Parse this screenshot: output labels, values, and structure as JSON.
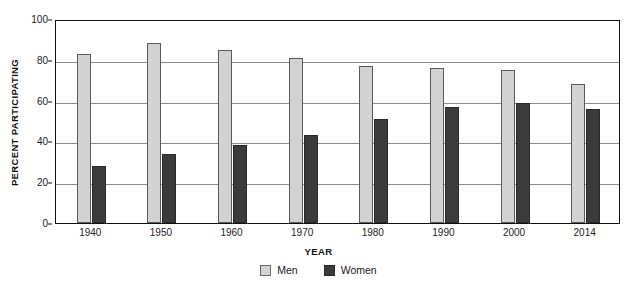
{
  "chart_data": {
    "type": "bar",
    "title": "",
    "xlabel": "YEAR",
    "ylabel": "PERCENT PARTICIPATING",
    "categories": [
      "1940",
      "1950",
      "1960",
      "1970",
      "1980",
      "1990",
      "2000",
      "2014"
    ],
    "series": [
      {
        "name": "Men",
        "color": "#d2d2d2",
        "values": [
          83,
          88,
          85,
          81,
          77,
          76,
          75,
          68
        ]
      },
      {
        "name": "Women",
        "color": "#3b3b3b",
        "values": [
          28,
          34,
          38,
          43,
          51,
          57,
          59,
          56
        ]
      }
    ],
    "ylim": [
      0,
      100
    ],
    "yticks": [
      0,
      20,
      40,
      60,
      80,
      100
    ],
    "ytick_labels": [
      "0",
      "20",
      "40",
      "60",
      "80",
      "100"
    ],
    "grid": true,
    "legend_position": "bottom"
  },
  "axes": {
    "y_title": "PERCENT PARTICIPATING",
    "x_title": "YEAR"
  },
  "legend": {
    "items": [
      {
        "label": "Men"
      },
      {
        "label": "Women"
      }
    ]
  }
}
